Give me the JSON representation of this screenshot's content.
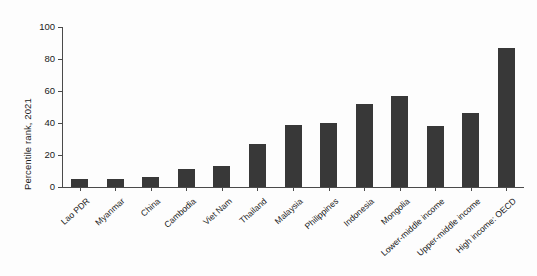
{
  "chart_data": {
    "type": "bar",
    "title": "",
    "xlabel": "",
    "ylabel": "Percentile rank, 2021",
    "ylim": [
      0,
      100
    ],
    "yticks": [
      0,
      20,
      40,
      60,
      80,
      100
    ],
    "grid": false,
    "legend": null,
    "bar_color": "#383838",
    "categories": [
      "Lao PDR",
      "Myanmar",
      "China",
      "Cambodia",
      "Viet Nam",
      "Thailand",
      "Malaysia",
      "Philippines",
      "Indonesia",
      "Mongolia",
      "Lower-middle income",
      "Upper-middle income",
      "High income: OECD"
    ],
    "values": [
      5,
      5,
      6,
      11,
      13,
      27,
      39,
      40,
      52,
      57,
      38,
      46,
      87
    ]
  }
}
